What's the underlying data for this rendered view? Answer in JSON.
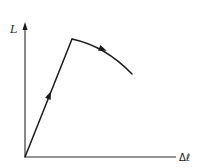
{
  "figure": {
    "type": "force-extension diagram",
    "y_axis": {
      "label": "L"
    },
    "x_axis": {
      "label": "Δℓ"
    },
    "segments": [
      {
        "name": "loading-line",
        "description": "straight rising line from origin to peak",
        "direction_arrow": "up"
      },
      {
        "name": "post-peak-curve",
        "description": "curve descending after peak",
        "direction_arrow": "right-down"
      }
    ]
  },
  "colors": {
    "ink": "#1a1a1a",
    "background": "#ffffff"
  }
}
